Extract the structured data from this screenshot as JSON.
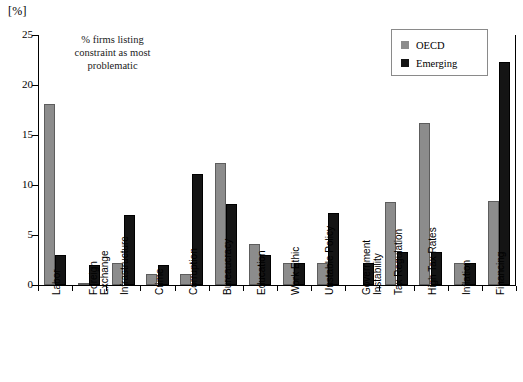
{
  "axis": {
    "unit_label": "[%]",
    "y_ticks": [
      0,
      5,
      10,
      15,
      20,
      25
    ],
    "y_min": 0,
    "y_max": 25
  },
  "annotation": {
    "line1": "% firms listing",
    "line2": "constraint as most",
    "line3": "problematic"
  },
  "legend": {
    "position": "top-right",
    "items": [
      {
        "label": "OECD",
        "color": "#8c8c8c"
      },
      {
        "label": "Emerging",
        "color": "#141414"
      }
    ]
  },
  "chart_data": {
    "type": "bar",
    "title": "",
    "subtitle": "% firms listing constraint as most problematic",
    "xlabel": "",
    "ylabel": "[%]",
    "ylim": [
      0,
      25
    ],
    "grid": false,
    "legend_position": "top-right",
    "categories": [
      "Labor",
      "Foreign Exchange",
      "Infrastructure",
      "Crime",
      "Corruption",
      "Bureaucracy",
      "Education",
      "Work Ethic",
      "Unstable Policy",
      "Government Instability",
      "Tax Regulation",
      "High Tax Rates",
      "Inflation",
      "Financing"
    ],
    "category_lines": [
      [
        "Labor"
      ],
      [
        "Foreign",
        "Exchange"
      ],
      [
        "Infrastructure"
      ],
      [
        "Crime"
      ],
      [
        "Corruption"
      ],
      [
        "Bureaucracy"
      ],
      [
        "Education"
      ],
      [
        "Work Ethic"
      ],
      [
        "Unstable Policy"
      ],
      [
        "Government",
        "Instability"
      ],
      [
        "Tax Regulation"
      ],
      [
        "High Tax Rates"
      ],
      [
        "Inflation"
      ],
      [
        "Financing"
      ]
    ],
    "series": [
      {
        "name": "OECD",
        "color": "#8c8c8c",
        "values": [
          18.1,
          0.2,
          2.2,
          1.1,
          1.1,
          12.2,
          4.1,
          2.2,
          2.2,
          0.0,
          8.3,
          16.2,
          2.2,
          8.4
        ]
      },
      {
        "name": "Emerging",
        "color": "#141414",
        "values": [
          3.0,
          2.0,
          7.0,
          2.0,
          11.1,
          8.1,
          3.0,
          2.2,
          7.2,
          2.2,
          3.3,
          3.3,
          2.2,
          22.3
        ]
      }
    ]
  }
}
